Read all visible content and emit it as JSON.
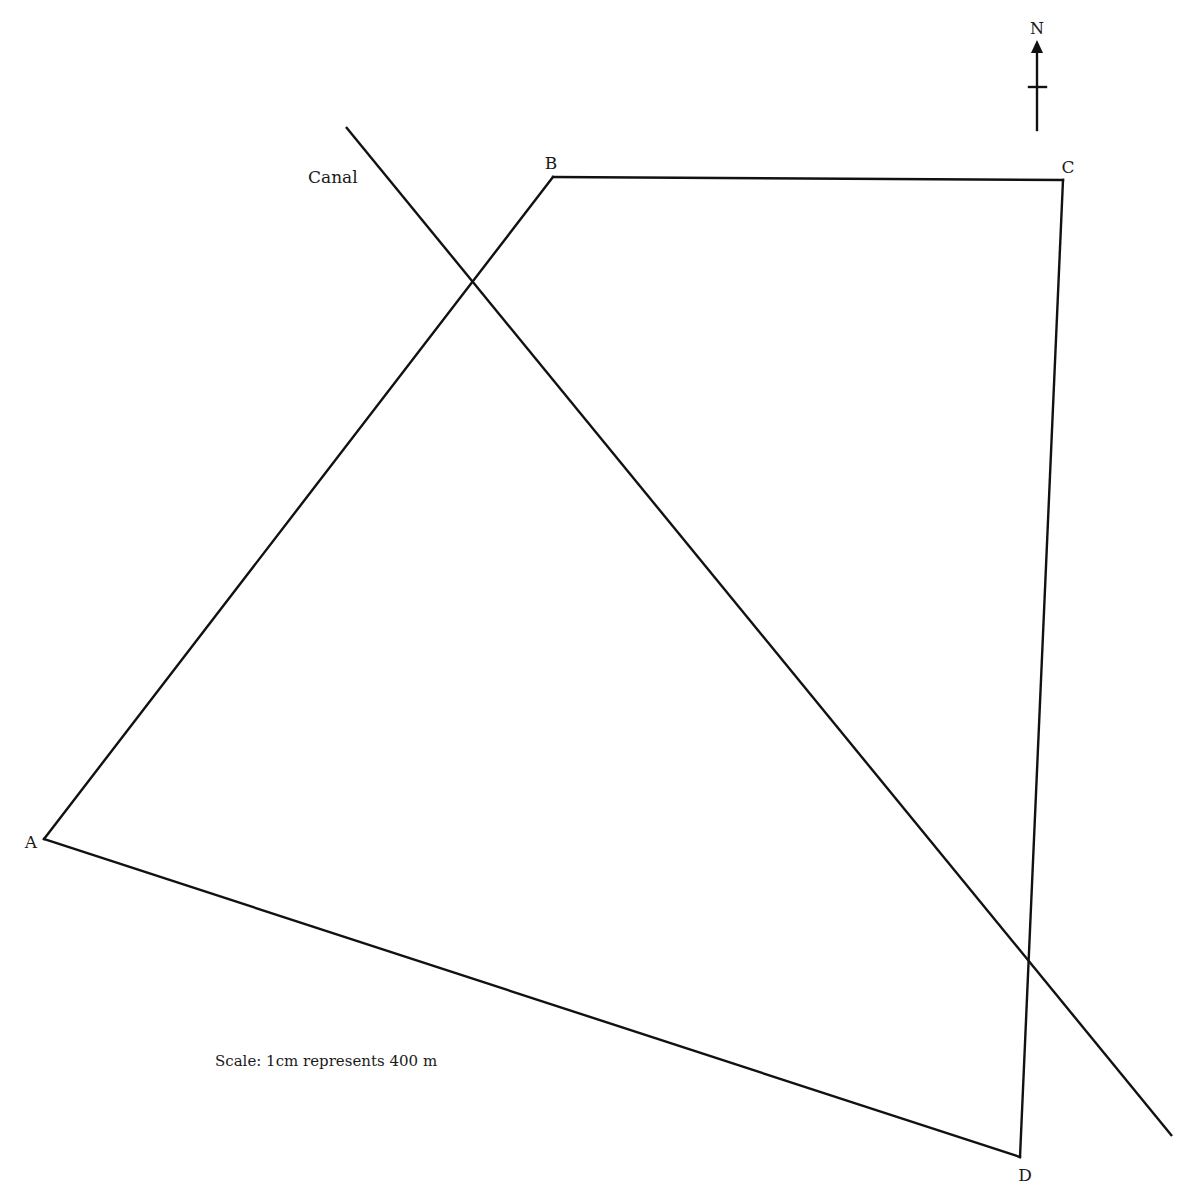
{
  "diagram": {
    "type": "scale-drawing",
    "north": {
      "label": "N",
      "x": 1037,
      "y_top": 40,
      "y_bottom": 130,
      "crossbar_y": 87
    },
    "vertices": [
      {
        "id": "A",
        "label": "A",
        "x": 44,
        "y": 839,
        "label_x": 31,
        "label_y": 848
      },
      {
        "id": "B",
        "label": "B",
        "x": 553,
        "y": 177,
        "label_x": 551,
        "label_y": 169
      },
      {
        "id": "C",
        "label": "C",
        "x": 1063,
        "y": 180,
        "label_x": 1068,
        "label_y": 173
      },
      {
        "id": "D",
        "label": "D",
        "x": 1020,
        "y": 1157,
        "label_x": 1025,
        "label_y": 1181
      }
    ],
    "edges": [
      {
        "from": "A",
        "to": "B"
      },
      {
        "from": "B",
        "to": "C"
      },
      {
        "from": "C",
        "to": "D"
      },
      {
        "from": "D",
        "to": "A"
      }
    ],
    "canal": {
      "label": "Canal",
      "x1": 346,
      "y1": 127,
      "x2": 1172,
      "y2": 1136,
      "label_x": 308,
      "label_y": 183
    },
    "scale": {
      "text": "Scale: 1cm represents 400 m",
      "x": 215,
      "y": 1066
    },
    "colors": {
      "line": "#111111",
      "text": "#1a1a1a",
      "background": "#ffffff"
    }
  }
}
